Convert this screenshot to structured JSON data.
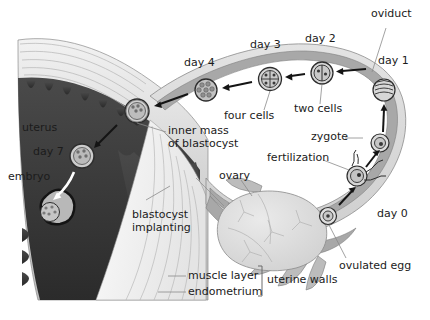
{
  "figure": {
    "background_color": "#ffffff",
    "ink_color": "#1b1b1b"
  },
  "palette": {
    "oviduct_wall": "#d9d9d9",
    "oviduct_lumen": "#a8a8a8",
    "uterus_light": "#e2e2e2",
    "endometrium_dark": "#3a3a3a",
    "ovary": "#dcdcdc",
    "muscle_layer": "#efefef",
    "outline": "#6b6b6b",
    "cell_fill": "#cfcfcf"
  },
  "labels": {
    "oviduct": "oviduct",
    "day0": "day 0",
    "day1": "day 1",
    "day2": "day 2",
    "day3": "day 3",
    "day4": "day 4",
    "day7": "day 7",
    "two_cells": "two cells",
    "four_cells": "four cells",
    "zygote": "zygote",
    "fertilization": "fertilization",
    "ovulated_egg": "ovulated egg",
    "ovary": "ovary",
    "uterus": "uterus",
    "embryo": "embryo",
    "inner_mass": "inner mass\nof blastocyst",
    "blastocyst_implanting": "blastocyst\nimplanting",
    "muscle_layer": "muscle layer",
    "endometrium": "endometrium",
    "uterine_walls": "uterine walls"
  },
  "stages": [
    {
      "key": "day0",
      "label": "day 0",
      "event": "ovulated egg",
      "location": "ovary / fimbriae"
    },
    {
      "key": "day0b",
      "label": "day 0",
      "event": "fertilization",
      "location": "ampulla of oviduct"
    },
    {
      "key": "day1",
      "label": "day 1",
      "event": "zygote",
      "location": "oviduct"
    },
    {
      "key": "day2",
      "label": "day 2",
      "event": "two cells",
      "location": "oviduct"
    },
    {
      "key": "day3",
      "label": "day 3",
      "event": "four cells",
      "location": "oviduct"
    },
    {
      "key": "day4",
      "label": "day 4",
      "event": "morula / blastocyst",
      "location": "oviduct near uterus"
    },
    {
      "key": "day7",
      "label": "day 7",
      "event": "blastocyst implanting",
      "location": "endometrium"
    }
  ],
  "anatomy": [
    {
      "name": "oviduct",
      "label": "oviduct"
    },
    {
      "name": "ovary",
      "label": "ovary"
    },
    {
      "name": "uterus",
      "label": "uterus"
    },
    {
      "name": "endometrium",
      "label": "endometrium"
    },
    {
      "name": "muscle-layer",
      "label": "muscle layer"
    },
    {
      "name": "uterine-walls",
      "label": "uterine walls"
    }
  ]
}
